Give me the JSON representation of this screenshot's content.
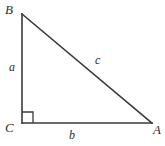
{
  "figure": {
    "type": "right-triangle-diagram",
    "canvas": {
      "width": 165,
      "height": 146,
      "background": "#ffffff"
    },
    "stroke": {
      "color": "#3a3a3a",
      "width": 1.6
    },
    "vertices": [
      {
        "name": "B",
        "label": "B",
        "x": 22,
        "y": 14
      },
      {
        "name": "C",
        "label": "C",
        "x": 22,
        "y": 123
      },
      {
        "name": "A",
        "label": "A",
        "x": 152,
        "y": 123
      }
    ],
    "sides": [
      {
        "name": "a",
        "label": "a",
        "from": "B",
        "to": "C",
        "description": "vertical leg"
      },
      {
        "name": "b",
        "label": "b",
        "from": "C",
        "to": "A",
        "description": "horizontal leg"
      },
      {
        "name": "c",
        "label": "c",
        "from": "A",
        "to": "B",
        "description": "hypotenuse"
      }
    ],
    "right_angle": {
      "at": "C",
      "marker": "square",
      "size": 11
    }
  }
}
